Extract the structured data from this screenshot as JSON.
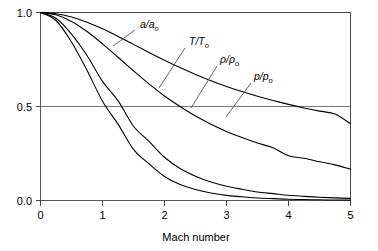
{
  "chart_data": {
    "type": "line",
    "title": "",
    "subtitle": "",
    "xlabel": "Mach number",
    "ylabel": "",
    "xlim": [
      0,
      5
    ],
    "ylim": [
      0,
      1
    ],
    "grid": true,
    "grid_lines_y": [
      0.5,
      1.0
    ],
    "legend_position": "inline-annotations",
    "xticks": [
      0,
      1,
      2,
      3,
      4,
      5
    ],
    "xtick_labels": [
      "0",
      "1",
      "2",
      "3",
      "4",
      "5"
    ],
    "yticks": [
      0.0,
      0.5,
      1.0
    ],
    "ytick_labels": [
      "0.0",
      "0.5",
      "1.0"
    ],
    "x": [
      0,
      0.25,
      0.5,
      0.75,
      1.0,
      1.25,
      1.5,
      1.75,
      2.0,
      2.25,
      2.5,
      2.75,
      3.0,
      3.25,
      3.5,
      3.75,
      4.0,
      4.25,
      4.5,
      4.75,
      5.0
    ],
    "series": [
      {
        "name": "a/a_o",
        "label_main": "a/a",
        "label_sub": "o",
        "values": [
          1.0,
          0.9938,
          0.9759,
          0.9482,
          0.9129,
          0.8729,
          0.8305,
          0.7878,
          0.7464,
          0.7071,
          0.6708,
          0.6374,
          0.6069,
          0.5793,
          0.5543,
          0.5316,
          0.5111,
          0.4924,
          0.4754,
          0.4599,
          0.4082
        ]
      },
      {
        "name": "T/T_o",
        "label_main": "T/T",
        "label_sub": "o",
        "values": [
          1.0,
          0.9876,
          0.9524,
          0.8989,
          0.8333,
          0.7619,
          0.6897,
          0.6207,
          0.5556,
          0.5,
          0.4494,
          0.4061,
          0.3676,
          0.3346,
          0.3053,
          0.28,
          0.2381,
          0.2247,
          0.2062,
          0.1895,
          0.1667
        ]
      },
      {
        "name": "rho/rho_o",
        "label_main": "ρ/ρ",
        "label_sub": "o",
        "values": [
          1.0,
          0.9693,
          0.8852,
          0.7716,
          0.6339,
          0.5311,
          0.395,
          0.3142,
          0.23,
          0.17,
          0.1289,
          0.0981,
          0.0762,
          0.06,
          0.0452,
          0.0366,
          0.0277,
          0.0222,
          0.0174,
          0.0139,
          0.0113
        ]
      },
      {
        "name": "p/p_o",
        "label_main": "p/p",
        "label_sub": "o",
        "values": [
          1.0,
          0.9575,
          0.843,
          0.6925,
          0.5283,
          0.406,
          0.2724,
          0.1953,
          0.1278,
          0.085,
          0.0585,
          0.04,
          0.0272,
          0.02,
          0.0131,
          0.0099,
          0.0066,
          0.005,
          0.0036,
          0.0026,
          0.0019
        ]
      }
    ],
    "annotations": [
      {
        "id": "ann-a-a0",
        "text_main": "a/a",
        "text_sub": "o",
        "x_text": 140,
        "y_text": 28,
        "leader_x1": 135,
        "leader_y1": 30,
        "leader_x2": 113,
        "leader_y2": 46
      },
      {
        "id": "ann-t-t0",
        "text_main": "T/T",
        "text_sub": "o",
        "x_text": 189,
        "y_text": 45,
        "leader_x1": 185,
        "leader_y1": 48,
        "leader_x2": 159,
        "leader_y2": 88
      },
      {
        "id": "ann-rho-rho0",
        "text_main": "ρ/ρ",
        "text_sub": "o",
        "x_text": 220,
        "y_text": 63,
        "leader_x1": 217,
        "leader_y1": 66,
        "leader_x2": 191,
        "leader_y2": 108
      },
      {
        "id": "ann-p-p0",
        "text_main": "p/p",
        "text_sub": "o",
        "x_text": 254,
        "y_text": 80,
        "leader_x1": 251,
        "leader_y1": 83,
        "leader_x2": 226,
        "leader_y2": 117
      }
    ]
  },
  "axis": {
    "x_title": "Mach number"
  },
  "colors": {
    "curve": "#000000",
    "frame": "#4a4a4a",
    "grid": "#777777",
    "background": "#ffffff",
    "text": "#000000"
  }
}
